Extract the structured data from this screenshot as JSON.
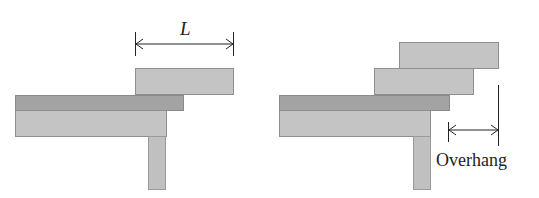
{
  "diagram": {
    "left_figure": {
      "dimension_label": "L"
    },
    "right_figure": {
      "overhang_label": "Overhang"
    },
    "colors": {
      "block_light": "#c4c4c4",
      "block_dark": "#a3a3a3",
      "line": "#222222"
    }
  }
}
